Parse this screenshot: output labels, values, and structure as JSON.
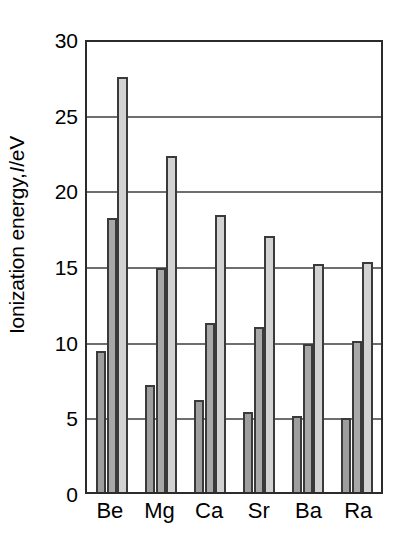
{
  "chart_data": {
    "type": "bar",
    "title": "",
    "xlabel": "",
    "ylabel": "Ionization energy, I/eV",
    "ylabel_prefix": "Ionization energy, ",
    "ylabel_italic": "I",
    "ylabel_suffix": "/eV",
    "categories": [
      "Be",
      "Mg",
      "Ca",
      "Sr",
      "Ba",
      "Ra"
    ],
    "ylim": [
      0,
      30
    ],
    "yticks": [
      0,
      5,
      10,
      15,
      20,
      25,
      30
    ],
    "ytick_labels": [
      "0",
      "5",
      "10",
      "15",
      "20",
      "25",
      "30"
    ],
    "grid": true,
    "grid_axis": "y",
    "legend": "none",
    "series": [
      {
        "name": "First ionization energy",
        "color": "#9e9e9e",
        "values": [
          9.3,
          7.1,
          6.1,
          5.3,
          5.0,
          4.9
        ]
      },
      {
        "name": "Second ionization energy",
        "color": "#a8a8a8",
        "values": [
          18.1,
          14.8,
          11.2,
          10.9,
          9.8,
          10.0
        ]
      },
      {
        "name": "Third ionization energy",
        "color": "#d2d2d2",
        "values": [
          27.4,
          22.2,
          18.3,
          16.9,
          15.1,
          15.2
        ]
      }
    ],
    "colors": {
      "series1": "#9e9e9e",
      "series2": "#a8a8a8",
      "series3": "#d2d2d2",
      "axis": "#2b2b2b",
      "grid": "#6e6e6e",
      "background": "#ffffff",
      "text": "#000000"
    }
  }
}
